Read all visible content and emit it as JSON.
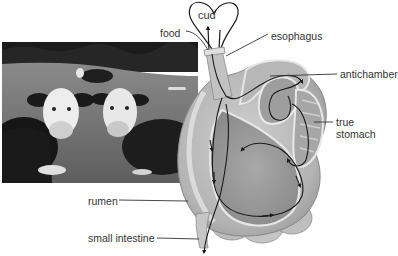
{
  "diagram": {
    "photo": {
      "description": "grayscale photo of cows on grass field",
      "alt": "cows in a pasture"
    },
    "labels": {
      "cud": "cud",
      "food": "food",
      "esophagus": "esophagus",
      "antichamber": "antichamber",
      "true_stomach_line1": "true",
      "true_stomach_line2": "stomach",
      "rumen": "rumen",
      "small_intestine": "small intestine"
    },
    "colors": {
      "background": "#ffffff",
      "organ_fill": "#b8b8b8",
      "organ_light": "#d9d9d9",
      "organ_dark": "#8f8f8f",
      "flow_line": "#1a1a1a",
      "label_text": "#333333",
      "photo_sky": "#2a2a2a",
      "photo_grass": "#6e6e6e"
    }
  }
}
